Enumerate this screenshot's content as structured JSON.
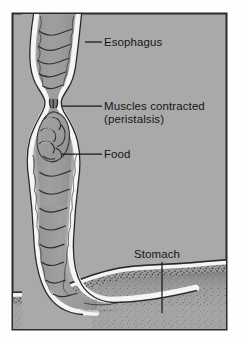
{
  "figure": {
    "type": "anatomical-illustration",
    "panel": {
      "background_color": "#a9a9a9",
      "border_color": "#2b2b2b",
      "x": 12,
      "y": 13,
      "width": 215,
      "height": 317
    },
    "colors": {
      "background": "#a9a9a9",
      "border": "#2b2b2b",
      "label_text": "#171717",
      "leader_line": "#1a1a1a",
      "tissue_fill": "#9a9a9a",
      "tissue_outline": "#2e2e2e",
      "highlight": "#f2f2f2",
      "stipple_dark": "#3a3a3a"
    }
  },
  "labels": [
    {
      "id": "esophagus",
      "text": "Esophagus",
      "x": 104,
      "y": 46,
      "leader": {
        "x1": 85,
        "y1": 42,
        "x2": 102,
        "y2": 42
      }
    },
    {
      "id": "muscles-contracted",
      "text": "Muscles contracted",
      "text_line2": "(peristalsis)",
      "x": 104,
      "y": 110,
      "y_line2": 123,
      "leader": {
        "x1": 62,
        "y1": 106,
        "x2": 102,
        "y2": 106
      }
    },
    {
      "id": "food",
      "text": "Food",
      "x": 104,
      "y": 158,
      "leader": {
        "x1": 62,
        "y1": 154,
        "x2": 102,
        "y2": 154
      }
    },
    {
      "id": "stomach",
      "text": "Stomach",
      "x": 134,
      "y": 258,
      "leader": {
        "x1": 162,
        "y1": 262,
        "x2": 162,
        "y2": 313
      }
    }
  ],
  "anatomy": {
    "esophagus": {
      "name": "esophagus-tube",
      "description": "Segmented muscular tube with scalloped chambers running vertically, narrowing at a contracted constriction."
    },
    "constriction": {
      "name": "peristaltic-constriction",
      "description": "Narrow pinch point where circular muscles are contracted above the food bolus."
    },
    "food_bolus": {
      "name": "food-bolus",
      "description": "Lobed rounded mass of swallowed food within the widened esophageal segment."
    },
    "stomach": {
      "name": "stomach-region",
      "description": "Stippled organ mass at lower right with a curved highlighted wall."
    }
  }
}
